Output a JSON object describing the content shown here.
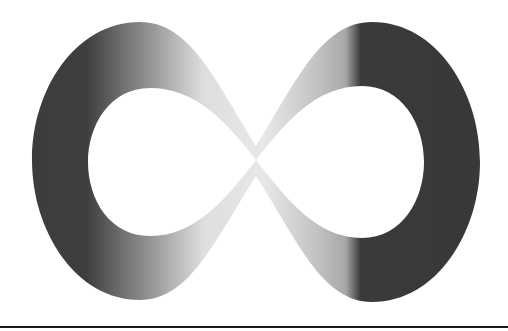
{
  "image": {
    "title": "Infinity symbol",
    "description": "Grayscale gradient infinity (lemniscate) symbol on white background",
    "colors": {
      "background": "#ffffff",
      "dark": "#3a3a3a",
      "mid": "#8a8a8a",
      "light": "#e6e6e6",
      "rule": "#1a1a1a"
    }
  }
}
